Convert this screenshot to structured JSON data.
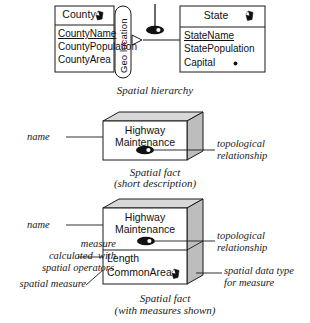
{
  "diagram": {
    "title_role": "spatial-data-warehouse-notation",
    "colors": {
      "stroke": "#1a1a1a",
      "fill": "#ffffff",
      "cube_top": "#d8d8d8",
      "cube_side": "#bdbdbd",
      "icon_fill": "#111111"
    }
  },
  "hierarchy": {
    "caption": "Spatial hierarchy",
    "child_entity": {
      "name": "County",
      "spatial_icon": "spatial-data-type-icon",
      "attributes": [
        {
          "label": "CountyName",
          "key": true
        },
        {
          "label": "CountyPopulation",
          "key": false
        },
        {
          "label": "CountyArea",
          "key": false
        }
      ]
    },
    "parent_entity": {
      "name": "State",
      "spatial_icon": "spatial-data-type-icon",
      "attributes": [
        {
          "label": "StateName",
          "key": true
        },
        {
          "label": "StatePopulation",
          "key": false
        },
        {
          "label": "Capital",
          "key": false,
          "trailing_icon": "point-spatial-icon"
        }
      ]
    },
    "level_name": "Geo location",
    "topological_icon": "topological-relationship-icon"
  },
  "fact_short": {
    "caption_line1": "Spatial fact",
    "caption_line2": "(short description)",
    "cube_name_line1": "Highway",
    "cube_name_line2": "Maintenance",
    "topological_icon": "topological-relationship-icon",
    "annotations": {
      "left": "name",
      "right_line1": "topological",
      "right_line2": "relationship"
    }
  },
  "fact_measures": {
    "caption_line1": "Spatial fact",
    "caption_line2": "(with measures shown)",
    "cube_name_line1": "Highway",
    "cube_name_line2": "Maintenance",
    "topological_icon": "topological-relationship-icon",
    "measures": [
      {
        "label": "Length",
        "spatial_icon": false
      },
      {
        "label": "CommonArea",
        "spatial_icon": true
      }
    ],
    "annotations": {
      "left_name": "name",
      "left_measure_line1": "measure",
      "left_measure_line2": "calculated  with",
      "left_measure_line3": "spatial operators",
      "left_spatial_measure": "spatial measure",
      "right_topo_line1": "topological",
      "right_topo_line2": "relationship",
      "right_type_line1": "spatial data type",
      "right_type_line2": "for measure"
    }
  }
}
